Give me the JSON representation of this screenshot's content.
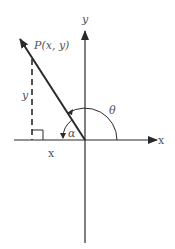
{
  "diagram": {
    "type": "angle-in-standard-position",
    "colors": {
      "stroke": "#2a2a2a",
      "text": "#555555",
      "background": "#ffffff"
    },
    "axes": {
      "x_label": "x",
      "y_label": "y"
    },
    "point": {
      "label": "P(x, y)"
    },
    "legs": {
      "vertical_label": "y",
      "horizontal_label": "x"
    },
    "angles": {
      "theta_label": "θ",
      "alpha_label": "α"
    }
  }
}
